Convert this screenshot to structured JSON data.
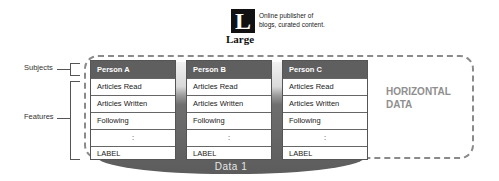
{
  "logo": {
    "glyph": "L",
    "word": "Large",
    "caption_line1": "Online publisher of",
    "caption_line2": "blogs, curated content."
  },
  "left_labels": {
    "subjects": "Subjects",
    "features": "Features"
  },
  "cards": [
    {
      "header": "Person A",
      "rows": [
        "Articles Read",
        "Articles Written",
        "Following",
        ":",
        "LABEL"
      ]
    },
    {
      "header": "Person B",
      "rows": [
        "Articles Read",
        "Articles Written",
        "Following",
        ":",
        "LABEL"
      ]
    },
    {
      "header": "Person C",
      "rows": [
        "Articles Read",
        "Articles Written",
        "Following",
        ":",
        "LABEL"
      ]
    }
  ],
  "container_label_line1": "HORIZONTAL",
  "container_label_line2": "DATA",
  "base_label": "Data 1",
  "colors": {
    "header_bg": "#5f5f5f",
    "dash": "#8a8a8a",
    "backdrop_dark": "#5c5c5c",
    "container_label": "#8f8f8f"
  }
}
